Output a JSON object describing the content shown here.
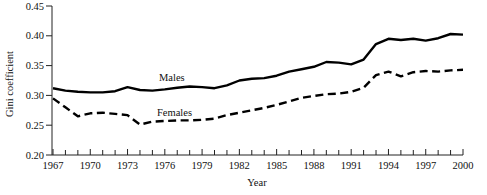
{
  "chart_data": {
    "type": "line",
    "xlabel": "Year",
    "ylabel": "Gini coefficient",
    "xlim": [
      1967,
      2000
    ],
    "ylim": [
      0.2,
      0.45
    ],
    "y_tick_interval": 0.05,
    "x_tick_minor_interval": 1,
    "x_tick_label_interval": 3,
    "grid": false,
    "legend": "inline-labels-on-lines",
    "line_color": "#000000",
    "x": [
      1967,
      1968,
      1969,
      1970,
      1971,
      1972,
      1973,
      1974,
      1975,
      1976,
      1977,
      1978,
      1979,
      1980,
      1981,
      1982,
      1983,
      1984,
      1985,
      1986,
      1987,
      1988,
      1989,
      1990,
      1991,
      1992,
      1993,
      1994,
      1995,
      1996,
      1997,
      1998,
      1999,
      2000
    ],
    "series": [
      {
        "name": "Males",
        "style": "solid",
        "color": "#000000",
        "values": [
          0.312,
          0.308,
          0.306,
          0.305,
          0.305,
          0.307,
          0.314,
          0.309,
          0.308,
          0.31,
          0.313,
          0.315,
          0.314,
          0.312,
          0.317,
          0.325,
          0.328,
          0.329,
          0.333,
          0.34,
          0.344,
          0.348,
          0.356,
          0.355,
          0.352,
          0.36,
          0.386,
          0.395,
          0.393,
          0.395,
          0.392,
          0.396,
          0.403,
          0.402
        ]
      },
      {
        "name": "Females",
        "style": "dashed",
        "color": "#000000",
        "values": [
          0.295,
          0.28,
          0.265,
          0.27,
          0.271,
          0.269,
          0.267,
          0.251,
          0.256,
          0.257,
          0.258,
          0.258,
          0.259,
          0.261,
          0.267,
          0.271,
          0.275,
          0.279,
          0.284,
          0.29,
          0.296,
          0.299,
          0.302,
          0.303,
          0.306,
          0.313,
          0.334,
          0.34,
          0.332,
          0.339,
          0.341,
          0.34,
          0.342,
          0.343
        ]
      }
    ]
  }
}
